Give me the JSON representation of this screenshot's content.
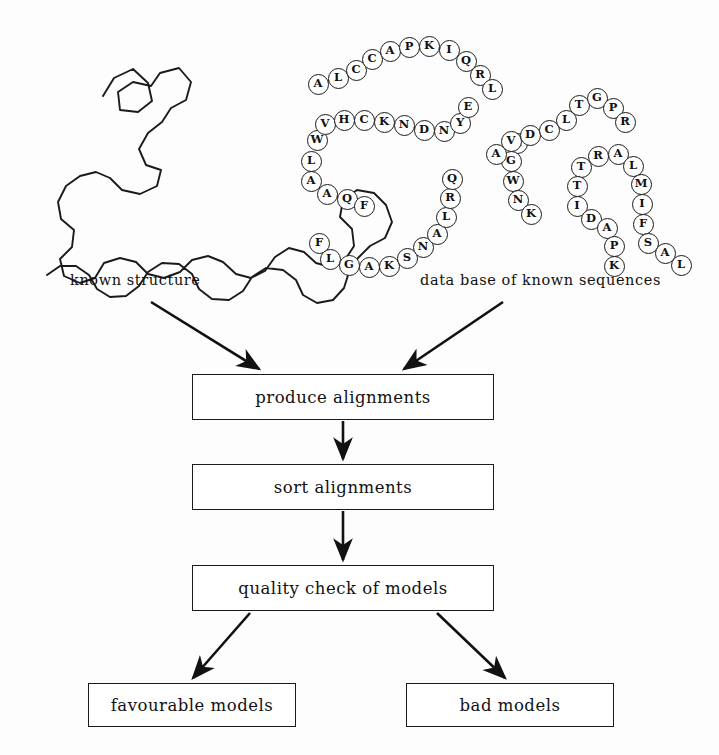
{
  "figure": {
    "background_color": "#fdfdfd",
    "ink_color": "#1a1a1a",
    "captions": {
      "structure": "known structure",
      "database": "data base of known sequences"
    }
  },
  "flow": {
    "boxes": [
      {
        "id": "produce",
        "label": "produce alignments"
      },
      {
        "id": "sort",
        "label": "sort alignments"
      },
      {
        "id": "quality",
        "label": "quality check of models"
      },
      {
        "id": "favour",
        "label": "favourable models"
      },
      {
        "id": "bad",
        "label": "bad models"
      }
    ]
  },
  "chart_data": {
    "type": "diagram",
    "nodes": [
      {
        "id": "known-structure",
        "label": "known structure",
        "kind": "input-illustration"
      },
      {
        "id": "known-sequences",
        "label": "data base of known sequences",
        "kind": "input-illustration"
      },
      {
        "id": "produce",
        "label": "produce alignments",
        "kind": "process"
      },
      {
        "id": "sort",
        "label": "sort alignments",
        "kind": "process"
      },
      {
        "id": "quality",
        "label": "quality check of models",
        "kind": "process"
      },
      {
        "id": "favour",
        "label": "favourable models",
        "kind": "output"
      },
      {
        "id": "bad",
        "label": "bad models",
        "kind": "output"
      }
    ],
    "edges": [
      {
        "from": "known-structure",
        "to": "produce"
      },
      {
        "from": "known-sequences",
        "to": "produce"
      },
      {
        "from": "produce",
        "to": "sort"
      },
      {
        "from": "sort",
        "to": "quality"
      },
      {
        "from": "quality",
        "to": "favour"
      },
      {
        "from": "quality",
        "to": "bad"
      }
    ],
    "legend": [],
    "grid": false
  },
  "sequence_beads": {
    "description": "Hand-drawn bead chain of single-letter amino acid codes",
    "chains": [
      {
        "id": "chain-upper",
        "residues": [
          "A",
          "L",
          "C",
          "C",
          "A",
          "P",
          "K",
          "I",
          "Q",
          "R",
          "L"
        ],
        "points": [
          [
            318,
            84
          ],
          [
            338,
            78
          ],
          [
            356,
            70
          ],
          [
            372,
            59
          ],
          [
            390,
            51
          ],
          [
            409,
            47
          ],
          [
            429,
            46
          ],
          [
            449,
            50
          ],
          [
            466,
            61
          ],
          [
            480,
            75
          ],
          [
            492,
            89
          ]
        ]
      },
      {
        "id": "chain-middle",
        "residues": [
          "W",
          "V",
          "H",
          "C",
          "K",
          "N",
          "D",
          "N",
          "Y",
          "E"
        ],
        "points": [
          [
            317,
            140
          ],
          [
            325,
            124
          ],
          [
            344,
            120
          ],
          [
            364,
            120
          ],
          [
            384,
            122
          ],
          [
            404,
            125
          ],
          [
            424,
            130
          ],
          [
            444,
            131
          ],
          [
            460,
            123
          ],
          [
            468,
            107
          ]
        ]
      },
      {
        "id": "chain-left-loop",
        "residues": [
          "L",
          "A",
          "A",
          "Q",
          "F"
        ],
        "points": [
          [
            311,
            161
          ],
          [
            311,
            181
          ],
          [
            327,
            194
          ],
          [
            347,
            199
          ],
          [
            364,
            206
          ]
        ]
      },
      {
        "id": "chain-bottom",
        "residues": [
          "F",
          "L",
          "G",
          "A",
          "K",
          "S",
          "N",
          "A",
          "L",
          "R",
          "Q"
        ],
        "points": [
          [
            319,
            243
          ],
          [
            330,
            259
          ],
          [
            349,
            265
          ],
          [
            369,
            267
          ],
          [
            389,
            266
          ],
          [
            407,
            258
          ],
          [
            423,
            247
          ],
          [
            437,
            234
          ],
          [
            446,
            217
          ],
          [
            450,
            198
          ],
          [
            452,
            179
          ]
        ]
      },
      {
        "id": "chain-center",
        "residues": [
          "A",
          "G",
          "W",
          "N",
          "K"
        ],
        "points": [
          [
            517,
            143
          ],
          [
            511,
            161
          ],
          [
            513,
            181
          ],
          [
            518,
            200
          ],
          [
            531,
            214
          ]
        ]
      },
      {
        "id": "chain-upper-right",
        "residues": [
          "A",
          "V",
          "D",
          "C",
          "L",
          "T",
          "G",
          "P",
          "R"
        ],
        "points": [
          [
            496,
            154
          ],
          [
            511,
            141
          ],
          [
            530,
            135
          ],
          [
            549,
            130
          ],
          [
            566,
            120
          ],
          [
            579,
            105
          ],
          [
            597,
            98
          ],
          [
            613,
            108
          ],
          [
            625,
            122
          ]
        ]
      },
      {
        "id": "chain-right-loop",
        "residues": [
          "T",
          "T",
          "I",
          "D",
          "A",
          "P",
          "K"
        ],
        "points": [
          [
            581,
            167
          ],
          [
            577,
            186
          ],
          [
            577,
            206
          ],
          [
            591,
            219
          ],
          [
            607,
            228
          ],
          [
            614,
            246
          ],
          [
            614,
            266
          ]
        ]
      },
      {
        "id": "chain-far-right",
        "residues": [
          "R",
          "A",
          "L",
          "M",
          "I",
          "F",
          "S",
          "A",
          "L"
        ],
        "points": [
          [
            598,
            156
          ],
          [
            618,
            154
          ],
          [
            633,
            166
          ],
          [
            641,
            184
          ],
          [
            642,
            204
          ],
          [
            643,
            224
          ],
          [
            648,
            243
          ],
          [
            665,
            253
          ],
          [
            681,
            265
          ]
        ]
      }
    ]
  },
  "structure_trace": {
    "description": "Hand-drawn polygonal backbone trace of a known protein structure",
    "polyline": [
      [
        103,
        96
      ],
      [
        114,
        78
      ],
      [
        133,
        69
      ],
      [
        148,
        83
      ],
      [
        152,
        101
      ],
      [
        138,
        112
      ],
      [
        120,
        110
      ],
      [
        118,
        92
      ],
      [
        133,
        82
      ],
      [
        151,
        86
      ],
      [
        160,
        73
      ],
      [
        179,
        68
      ],
      [
        191,
        82
      ],
      [
        186,
        100
      ],
      [
        171,
        108
      ],
      [
        162,
        122
      ],
      [
        148,
        133
      ],
      [
        139,
        149
      ],
      [
        146,
        165
      ],
      [
        161,
        170
      ],
      [
        157,
        186
      ],
      [
        140,
        194
      ],
      [
        122,
        190
      ],
      [
        110,
        178
      ],
      [
        96,
        172
      ],
      [
        80,
        176
      ],
      [
        66,
        186
      ],
      [
        58,
        202
      ],
      [
        61,
        219
      ],
      [
        74,
        230
      ],
      [
        72,
        247
      ],
      [
        60,
        259
      ],
      [
        64,
        276
      ],
      [
        80,
        283
      ],
      [
        95,
        278
      ],
      [
        104,
        263
      ],
      [
        120,
        258
      ],
      [
        136,
        262
      ],
      [
        148,
        274
      ],
      [
        164,
        278
      ],
      [
        180,
        272
      ],
      [
        192,
        260
      ],
      [
        208,
        256
      ],
      [
        223,
        262
      ],
      [
        236,
        274
      ],
      [
        251,
        278
      ],
      [
        265,
        271
      ],
      [
        275,
        257
      ],
      [
        289,
        248
      ],
      [
        304,
        252
      ],
      [
        316,
        263
      ],
      [
        331,
        267
      ],
      [
        345,
        260
      ],
      [
        354,
        246
      ],
      [
        352,
        229
      ],
      [
        340,
        217
      ],
      [
        343,
        200
      ],
      [
        357,
        190
      ],
      [
        374,
        193
      ],
      [
        386,
        205
      ],
      [
        392,
        222
      ],
      [
        385,
        238
      ],
      [
        370,
        246
      ],
      [
        358,
        258
      ],
      [
        349,
        272
      ],
      [
        344,
        288
      ],
      [
        333,
        300
      ],
      [
        317,
        303
      ],
      [
        303,
        295
      ],
      [
        296,
        280
      ],
      [
        283,
        270
      ],
      [
        266,
        268
      ],
      [
        252,
        277
      ],
      [
        243,
        291
      ],
      [
        229,
        300
      ],
      [
        212,
        299
      ],
      [
        199,
        289
      ],
      [
        192,
        274
      ],
      [
        179,
        264
      ],
      [
        162,
        263
      ],
      [
        148,
        272
      ],
      [
        139,
        286
      ],
      [
        126,
        296
      ],
      [
        110,
        297
      ],
      [
        97,
        289
      ],
      [
        89,
        275
      ],
      [
        76,
        266
      ],
      [
        60,
        266
      ],
      [
        47,
        275
      ]
    ]
  }
}
